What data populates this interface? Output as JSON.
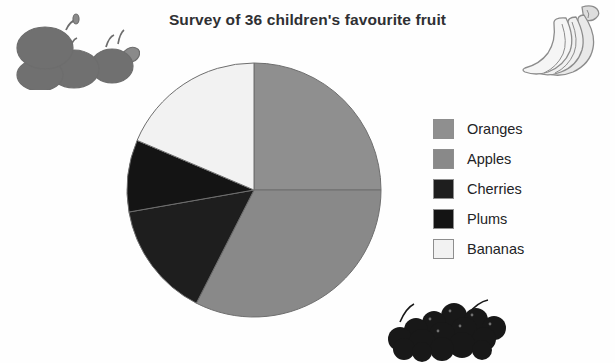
{
  "title": "Survey of 36 children's favourite fruit",
  "legend": {
    "items": [
      {
        "label": "Oranges",
        "color": "#8f8f8f"
      },
      {
        "label": "Apples",
        "color": "#898989"
      },
      {
        "label": "Cherries",
        "color": "#1e1e1e"
      },
      {
        "label": "Plums",
        "color": "#141414"
      },
      {
        "label": "Bananas",
        "color": "#f2f2f2"
      }
    ]
  },
  "illustrations": [
    {
      "name": "apples-illustration",
      "alt": "cluster of apples"
    },
    {
      "name": "bananas-illustration",
      "alt": "bunch of bananas"
    },
    {
      "name": "cherries-illustration",
      "alt": "pile of cherries"
    }
  ],
  "chart_data": {
    "type": "pie",
    "title": "Survey of 36 children's favourite fruit",
    "total": 36,
    "units": "children",
    "start_angle_deg": 0,
    "direction": "clockwise",
    "legend_position": "right",
    "categories": [
      "Oranges",
      "Apples",
      "Cherries",
      "Plums",
      "Bananas"
    ],
    "values": [
      9,
      12,
      5,
      3,
      7
    ],
    "percentages": [
      25,
      33.3,
      13.9,
      8.3,
      19.4
    ],
    "angles_deg": [
      90,
      117,
      53,
      33,
      67
    ],
    "colors": [
      "#8f8f8f",
      "#898989",
      "#1e1e1e",
      "#141414",
      "#f2f2f2"
    ],
    "slices": [
      {
        "name": "Oranges",
        "value": 9,
        "start_deg": 0,
        "end_deg": 90,
        "color": "#8f8f8f"
      },
      {
        "name": "Apples",
        "value": 12,
        "start_deg": 90,
        "end_deg": 207,
        "color": "#898989"
      },
      {
        "name": "Cherries",
        "value": 5,
        "start_deg": 207,
        "end_deg": 260,
        "color": "#1e1e1e"
      },
      {
        "name": "Plums",
        "value": 3,
        "start_deg": 260,
        "end_deg": 293,
        "color": "#141414"
      },
      {
        "name": "Bananas",
        "value": 7,
        "start_deg": 293,
        "end_deg": 360,
        "color": "#f2f2f2"
      }
    ],
    "geometry": {
      "cx": 128,
      "cy": 128,
      "r": 127
    },
    "stroke": "#6e6e6e",
    "stroke_width": 1
  }
}
